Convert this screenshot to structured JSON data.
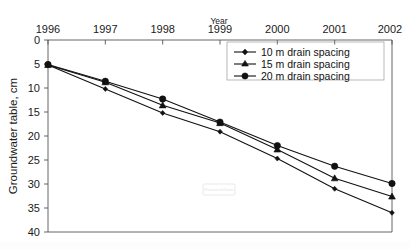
{
  "chart_data": {
    "type": "line",
    "title": "",
    "xlabel": "Year",
    "ylabel": "Groundwater table, cm",
    "x": [
      1996,
      1997,
      1998,
      1999,
      2000,
      2001,
      2002
    ],
    "xticklabels": [
      "1996",
      "1997",
      "1998",
      "1999",
      "2000",
      "2001",
      "2002"
    ],
    "xlim": [
      1996,
      2002
    ],
    "ylim": [
      0,
      40
    ],
    "y_inverted": true,
    "yticks": [
      0,
      5,
      10,
      15,
      20,
      25,
      30,
      35,
      40
    ],
    "yticklabels": [
      "0",
      "5",
      "10",
      "15",
      "20",
      "25",
      "30",
      "35",
      "40"
    ],
    "grid": false,
    "legend_position": "top-right",
    "series": [
      {
        "name": "10 m drain spacing",
        "marker": "diamond",
        "color": "#111111",
        "values": [
          5.2,
          10.2,
          15.2,
          19.1,
          24.7,
          31.0,
          36.0
        ]
      },
      {
        "name": "15 m drain spacing",
        "marker": "triangle",
        "color": "#111111",
        "values": [
          5.2,
          8.8,
          13.6,
          17.3,
          22.8,
          28.8,
          32.6
        ]
      },
      {
        "name": "20 m drain spacing",
        "marker": "circle",
        "color": "#111111",
        "values": [
          5.1,
          8.6,
          12.3,
          17.1,
          22.0,
          26.3,
          29.9
        ]
      }
    ],
    "annotations": [
      {
        "name": "watermark",
        "text": "ResearchGate"
      }
    ]
  },
  "legend": {
    "items": [
      {
        "label": "10 m drain spacing",
        "marker": "diamond"
      },
      {
        "label": "15 m drain spacing",
        "marker": "triangle"
      },
      {
        "label": "20 m drain spacing",
        "marker": "circle"
      }
    ]
  },
  "axes": {
    "x_title": "Year",
    "y_title": "Groundwater table, cm"
  }
}
